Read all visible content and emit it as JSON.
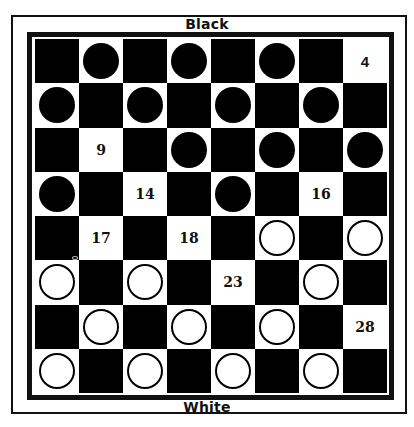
{
  "labels": {
    "top": "Black",
    "bottom": "White"
  },
  "colors": {
    "dark_square": "#000000",
    "light_square": "#ffffff",
    "black_piece": "#000000",
    "white_piece": "#ffffff"
  },
  "board": {
    "rows": [
      [
        {
          "c": "dark"
        },
        {
          "c": "light",
          "p": "black"
        },
        {
          "c": "dark"
        },
        {
          "c": "light",
          "p": "black"
        },
        {
          "c": "dark"
        },
        {
          "c": "light",
          "p": "black"
        },
        {
          "c": "dark"
        },
        {
          "c": "light",
          "n": "4",
          "sans": true
        }
      ],
      [
        {
          "c": "light",
          "p": "black"
        },
        {
          "c": "dark"
        },
        {
          "c": "light",
          "p": "black"
        },
        {
          "c": "dark"
        },
        {
          "c": "light",
          "p": "black"
        },
        {
          "c": "dark"
        },
        {
          "c": "light",
          "p": "black"
        },
        {
          "c": "dark"
        }
      ],
      [
        {
          "c": "dark"
        },
        {
          "c": "light",
          "n": "9"
        },
        {
          "c": "dark"
        },
        {
          "c": "light",
          "p": "black"
        },
        {
          "c": "dark"
        },
        {
          "c": "light",
          "p": "black"
        },
        {
          "c": "dark"
        },
        {
          "c": "light",
          "p": "black"
        }
      ],
      [
        {
          "c": "light",
          "p": "black"
        },
        {
          "c": "dark"
        },
        {
          "c": "light",
          "n": "14"
        },
        {
          "c": "dark"
        },
        {
          "c": "light",
          "p": "black"
        },
        {
          "c": "dark"
        },
        {
          "c": "light",
          "n": "16"
        },
        {
          "c": "dark"
        }
      ],
      [
        {
          "c": "dark"
        },
        {
          "c": "light",
          "n": "17"
        },
        {
          "c": "dark"
        },
        {
          "c": "light",
          "n": "18"
        },
        {
          "c": "dark"
        },
        {
          "c": "light",
          "p": "white"
        },
        {
          "c": "dark"
        },
        {
          "c": "light",
          "p": "white"
        }
      ],
      [
        {
          "c": "light",
          "p": "white"
        },
        {
          "c": "dark"
        },
        {
          "c": "light",
          "p": "white"
        },
        {
          "c": "dark"
        },
        {
          "c": "light",
          "n": "23"
        },
        {
          "c": "dark"
        },
        {
          "c": "light",
          "p": "white"
        },
        {
          "c": "dark"
        }
      ],
      [
        {
          "c": "dark"
        },
        {
          "c": "light",
          "p": "white"
        },
        {
          "c": "dark"
        },
        {
          "c": "light",
          "p": "white"
        },
        {
          "c": "dark"
        },
        {
          "c": "light",
          "p": "white"
        },
        {
          "c": "dark"
        },
        {
          "c": "light",
          "n": "28"
        }
      ],
      [
        {
          "c": "light",
          "p": "white"
        },
        {
          "c": "dark"
        },
        {
          "c": "light",
          "p": "white"
        },
        {
          "c": "dark"
        },
        {
          "c": "light",
          "p": "white"
        },
        {
          "c": "dark"
        },
        {
          "c": "light",
          "p": "white"
        },
        {
          "c": "dark"
        }
      ]
    ]
  },
  "summary": {
    "black_piece_count": 12,
    "white_piece_count": 12,
    "empty_numbered_squares": [
      "4",
      "9",
      "14",
      "16",
      "17",
      "18",
      "23",
      "28"
    ]
  }
}
